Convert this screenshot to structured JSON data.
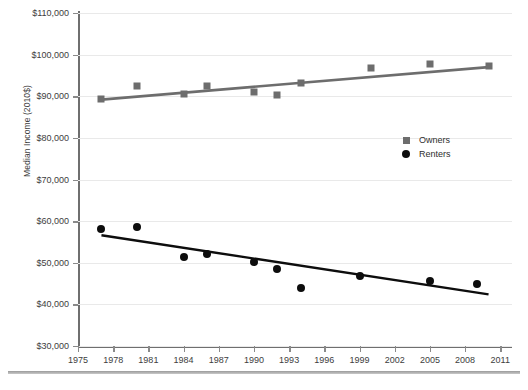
{
  "chart_data": {
    "type": "scatter",
    "title": "",
    "xlabel": "",
    "ylabel": "Median Income (2010$)",
    "xlim": [
      1975,
      2012
    ],
    "ylim": [
      30000,
      110000
    ],
    "grid": true,
    "legend_position": "center-right",
    "x_ticks": [
      1975,
      1978,
      1981,
      1984,
      1987,
      1990,
      1993,
      1996,
      1999,
      2002,
      2005,
      2008,
      2011
    ],
    "y_ticks": [
      30000,
      40000,
      50000,
      60000,
      70000,
      80000,
      90000,
      100000,
      110000
    ],
    "y_tick_labels": [
      "$30,000",
      "$40,000",
      "$50,000",
      "$60,000",
      "$70,000",
      "$80,000",
      "$90,000",
      "$100,000",
      "$110,000"
    ],
    "x_tick_labels": [
      "1975",
      "1978",
      "1981",
      "1984",
      "1987",
      "1990",
      "1993",
      "1996",
      "1999",
      "2002",
      "2005",
      "2008",
      "2011"
    ],
    "series": [
      {
        "name": "Owners",
        "marker": "square",
        "color": "#6d6d6d",
        "x": [
          1977,
          1980,
          1984,
          1986,
          1990,
          1992,
          1994,
          2000,
          2005,
          2010
        ],
        "values": [
          89400,
          92500,
          90600,
          92400,
          91000,
          90200,
          93200,
          96800,
          97800,
          97300
        ],
        "trendline": {
          "x": [
            1977,
            2010
          ],
          "y": [
            89200,
            97000
          ],
          "color": "#6d6d6d"
        }
      },
      {
        "name": "Renters",
        "marker": "circle",
        "color": "#0d0d0d",
        "x": [
          1977,
          1980,
          1984,
          1986,
          1990,
          1992,
          1994,
          1999,
          2005,
          2009
        ],
        "values": [
          58000,
          58500,
          51500,
          52200,
          50200,
          48400,
          44000,
          46800,
          45700,
          45000
        ],
        "trendline": {
          "x": [
            1977,
            2010
          ],
          "y": [
            56600,
            42400
          ],
          "color": "#0d0d0d"
        }
      }
    ],
    "legend": [
      {
        "label": "Owners",
        "marker": "square",
        "color": "#6d6d6d"
      },
      {
        "label": "Renters",
        "marker": "circle",
        "color": "#0d0d0d"
      }
    ]
  }
}
